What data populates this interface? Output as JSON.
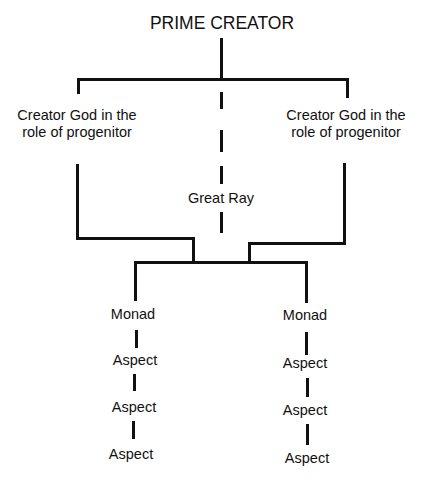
{
  "diagram": {
    "title": "PRIME CREATOR",
    "left_progenitor": {
      "line1": "Creator God in the",
      "line2": "role of progenitor"
    },
    "right_progenitor": {
      "line1": "Creator God in the",
      "line2": "role of progenitor"
    },
    "center_ray": "Great Ray",
    "left_branch": {
      "monad": "Monad",
      "aspects": [
        "Aspect",
        "Aspect",
        "Aspect"
      ]
    },
    "right_branch": {
      "monad": "Monad",
      "aspects": [
        "Aspect",
        "Aspect",
        "Aspect"
      ]
    },
    "line_color": "#111111"
  }
}
